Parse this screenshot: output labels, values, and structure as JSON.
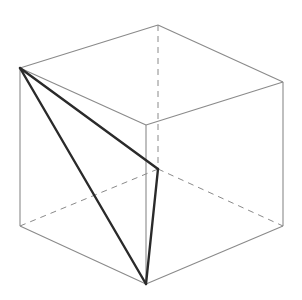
{
  "diagram": {
    "type": "cube-with-inscribed-triangle",
    "colors": {
      "background": "#ffffff",
      "edge": "#8a8a8a",
      "hidden_edge": "#8a8a8a",
      "triangle": "#2a2a2a"
    },
    "vertices": {
      "A": [
        20,
        68
      ],
      "B": [
        158,
        25
      ],
      "C": [
        283,
        82
      ],
      "D": [
        146,
        125
      ],
      "E": [
        20,
        226
      ],
      "F": [
        146,
        284
      ],
      "G": [
        283,
        226
      ],
      "H": [
        158,
        169
      ]
    },
    "visible_edges": [
      [
        "A",
        "B"
      ],
      [
        "B",
        "C"
      ],
      [
        "C",
        "D"
      ],
      [
        "D",
        "A"
      ],
      [
        "A",
        "E"
      ],
      [
        "D",
        "F"
      ],
      [
        "C",
        "G"
      ],
      [
        "E",
        "F"
      ],
      [
        "F",
        "G"
      ]
    ],
    "hidden_edges": [
      [
        "B",
        "H"
      ],
      [
        "E",
        "H"
      ],
      [
        "H",
        "G"
      ]
    ],
    "triangle": [
      "A",
      "H",
      "F"
    ],
    "labels": []
  }
}
